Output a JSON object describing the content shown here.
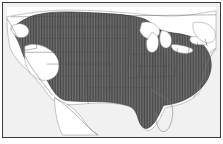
{
  "figure": {
    "kind": "species-range-map",
    "title": "",
    "frame_color": "#3a3a3a",
    "ocean_color": "#f1f1f1",
    "land_color": "#ffffff",
    "range_fill_color": "#6f6f6f",
    "range_hatch_color": "#4a4a4a",
    "boundary_color": "#555555",
    "coastline_color": "#7a7a7a"
  },
  "map": {
    "region_label": "United States",
    "projection_note": "conterminous United States with southern Canada and northern Mexico",
    "legend": {
      "shaded_label": "Range",
      "unshaded_label": "Outside range"
    },
    "range_description": "Shaded distribution covers the central and eastern United States from the Pacific Northwest coast south along California, across the Great Plains and Midwest, and east to the Atlantic coast including Florida; unshaded gaps occur in the Great Basin, the Great Lakes, northern New England, Canada, and interior Mexico."
  },
  "features": {
    "great_lakes": [
      "Lake Superior",
      "Lake Michigan",
      "Lake Huron",
      "Lake Erie",
      "Lake Ontario"
    ],
    "water_label": "Great Lakes",
    "gulf_label": "Gulf of Mexico",
    "atlantic_label": "Atlantic Ocean",
    "pacific_label": "Pacific Ocean"
  }
}
